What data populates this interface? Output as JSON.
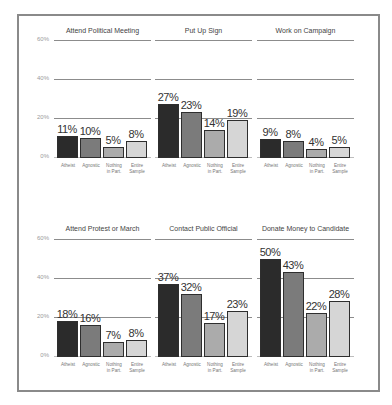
{
  "chart_data": [
    {
      "type": "bar",
      "title": "Attend Political Meeting",
      "categories": [
        "Atheist",
        "Agnostic",
        "Nothing in Part.",
        "Entire Sample"
      ],
      "values": [
        11,
        10,
        5,
        8
      ],
      "value_labels": [
        "11%",
        "10%",
        "5%",
        "8%"
      ],
      "ylim": [
        0,
        60
      ],
      "yticks": [
        "0%",
        "20%",
        "40%",
        "60%"
      ],
      "grid": true
    },
    {
      "type": "bar",
      "title": "Put Up Sign",
      "categories": [
        "Atheist",
        "Agnostic",
        "Nothing in Part.",
        "Entire Sample"
      ],
      "values": [
        27,
        23,
        14,
        19
      ],
      "value_labels": [
        "27%",
        "23%",
        "14%",
        "19%"
      ],
      "ylim": [
        0,
        60
      ],
      "grid": true
    },
    {
      "type": "bar",
      "title": "Work on Campaign",
      "categories": [
        "Atheist",
        "Agnostic",
        "Nothing in Part.",
        "Entire Sample"
      ],
      "values": [
        9,
        8,
        4,
        5
      ],
      "value_labels": [
        "9%",
        "8%",
        "4%",
        "5%"
      ],
      "ylim": [
        0,
        60
      ],
      "grid": true
    },
    {
      "type": "bar",
      "title": "Attend Protest or March",
      "categories": [
        "Atheist",
        "Agnostic",
        "Nothing in Part.",
        "Entire Sample"
      ],
      "values": [
        18,
        16,
        7,
        8
      ],
      "value_labels": [
        "18%",
        "16%",
        "7%",
        "8%"
      ],
      "ylim": [
        0,
        60
      ],
      "yticks": [
        "0%",
        "20%",
        "40%",
        "60%"
      ],
      "grid": true
    },
    {
      "type": "bar",
      "title": "Contact Public Official",
      "categories": [
        "Atheist",
        "Agnostic",
        "Nothing in Part.",
        "Entire Sample"
      ],
      "values": [
        37,
        32,
        17,
        23
      ],
      "value_labels": [
        "37%",
        "32%",
        "17%",
        "23%"
      ],
      "ylim": [
        0,
        60
      ],
      "grid": true
    },
    {
      "type": "bar",
      "title": "Donate Money to Candidate",
      "categories": [
        "Atheist",
        "Agnostic",
        "Nothing in Part.",
        "Entire Sample"
      ],
      "values": [
        50,
        43,
        22,
        28
      ],
      "value_labels": [
        "50%",
        "43%",
        "22%",
        "28%"
      ],
      "ylim": [
        0,
        60
      ],
      "grid": true
    }
  ],
  "axis": {
    "yticks": [
      "0%",
      "20%",
      "40%",
      "60%"
    ],
    "xlabels": [
      {
        "line1": "Atheist",
        "line2": ""
      },
      {
        "line1": "Agnostic",
        "line2": ""
      },
      {
        "line1": "Nothing",
        "line2": "in Part."
      },
      {
        "line1": "Entire",
        "line2": "Sample"
      }
    ]
  },
  "colors": {
    "atheist": "#2b2b2b",
    "agnostic": "#7b7b7b",
    "nothing": "#ababab",
    "entire": "#d6d6d6",
    "outline": "#2e2e2e",
    "grid": "#8c8c8c",
    "frame": "#8a8a8a"
  }
}
